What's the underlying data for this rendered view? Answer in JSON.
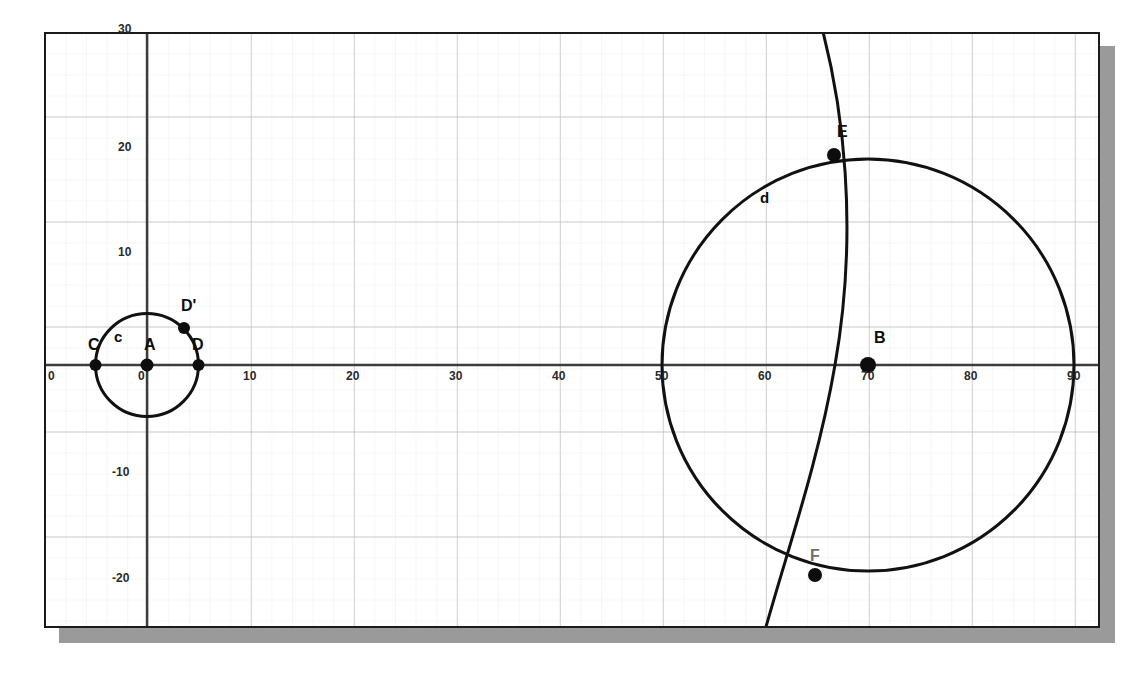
{
  "figure": {
    "background_color": "#ffffff",
    "panel_border_color": "#1a1a1a",
    "shadow_color": "#9a9a9a",
    "stroke_color": "#111111",
    "major_grid_color": "#b9b9b9",
    "minor_grid_color": "#ececec",
    "axis_color": "#3a3a3a"
  },
  "axes": {
    "x_label_values": [
      "0",
      "10",
      "20",
      "30",
      "40",
      "50",
      "60",
      "70",
      "80",
      "90"
    ],
    "y_label_values": [
      "30",
      "20",
      "10",
      "-10",
      "-20"
    ],
    "edge_origin_label": "0",
    "x_range": [
      -9.8,
      92.8
    ],
    "y_range": [
      -28.2,
      31.5
    ],
    "major_step": 10,
    "minor_step": 2,
    "grid": "on"
  },
  "chart_data": {
    "type": "scatter",
    "xlabel": "",
    "ylabel": "",
    "xlim": [
      -9.8,
      92.8
    ],
    "ylim": [
      -28.2,
      31.5
    ],
    "grid": true,
    "shapes": [
      {
        "name": "c",
        "kind": "circle",
        "center": [
          0,
          0
        ],
        "radius": 5,
        "label": "c",
        "label_pos": [
          -2.4,
          2.3
        ]
      },
      {
        "name": "d",
        "kind": "circle",
        "center": [
          70,
          0
        ],
        "radius": 20,
        "label": "d",
        "label_pos": [
          58.2,
          13.0
        ]
      },
      {
        "name": "arc-EF",
        "kind": "arc",
        "through": [
          [
            66.7,
            20.0
          ],
          [
            65.0,
            -20.0
          ]
        ],
        "bulge_left": true
      }
    ],
    "points": [
      {
        "label": "A",
        "x": 0,
        "y": 0,
        "label_dx": -1.8,
        "label_dy": 2.2
      },
      {
        "label": "C",
        "x": -5,
        "y": 0,
        "label_dx": -1.3,
        "label_dy": 2.2
      },
      {
        "label": "D",
        "x": 5,
        "y": 0,
        "label_dx": -1.0,
        "label_dy": 2.2
      },
      {
        "label": "D'",
        "x": 3.6,
        "y": 3.6,
        "label_dx": 0.9,
        "label_dy": 2.6
      },
      {
        "label": "B",
        "x": 70,
        "y": 0,
        "label_dx": 0.9,
        "label_dy": 2.7
      },
      {
        "label": "E",
        "x": 66.7,
        "y": 20.0,
        "label_dx": 0.9,
        "label_dy": 2.6
      },
      {
        "label": "F",
        "x": 65.0,
        "y": -20.0,
        "label_dx": 0.7,
        "label_dy": 2.5
      }
    ]
  },
  "tick_labels": {
    "x": [
      {
        "text": "0",
        "px": 48,
        "py": 370
      },
      {
        "text": "0",
        "px": 138,
        "py": 370
      },
      {
        "text": "10",
        "px": 243,
        "py": 370
      },
      {
        "text": "20",
        "px": 346,
        "py": 370
      },
      {
        "text": "30",
        "px": 449,
        "py": 370
      },
      {
        "text": "40",
        "px": 552,
        "py": 370
      },
      {
        "text": "50",
        "px": 655,
        "py": 370
      },
      {
        "text": "60",
        "px": 758,
        "py": 370
      },
      {
        "text": "70",
        "px": 861,
        "py": 370
      },
      {
        "text": "80",
        "px": 964,
        "py": 370
      },
      {
        "text": "90",
        "px": 1067,
        "py": 370
      }
    ],
    "y": [
      {
        "text": "30",
        "px": 118,
        "py": 23
      },
      {
        "text": "20",
        "px": 118,
        "py": 141
      },
      {
        "text": "10",
        "px": 118,
        "py": 246
      },
      {
        "text": "-10",
        "px": 112,
        "py": 466
      },
      {
        "text": "-20",
        "px": 112,
        "py": 572
      }
    ]
  },
  "point_labels": [
    {
      "text": "C",
      "px": 88,
      "py": 337,
      "faint": false
    },
    {
      "text": "c",
      "px": 114,
      "py": 329,
      "faint": false
    },
    {
      "text": "A",
      "px": 144,
      "py": 337,
      "faint": false
    },
    {
      "text": "D",
      "px": 192,
      "py": 337,
      "faint": false
    },
    {
      "text": "D'",
      "px": 181,
      "py": 298,
      "faint": false
    },
    {
      "text": "B",
      "px": 874,
      "py": 330,
      "faint": false
    },
    {
      "text": "E",
      "px": 837,
      "py": 124,
      "faint": false
    },
    {
      "text": "d",
      "px": 760,
      "py": 190,
      "faint": false
    },
    {
      "text": "F",
      "px": 810,
      "py": 548,
      "faint": true
    }
  ]
}
